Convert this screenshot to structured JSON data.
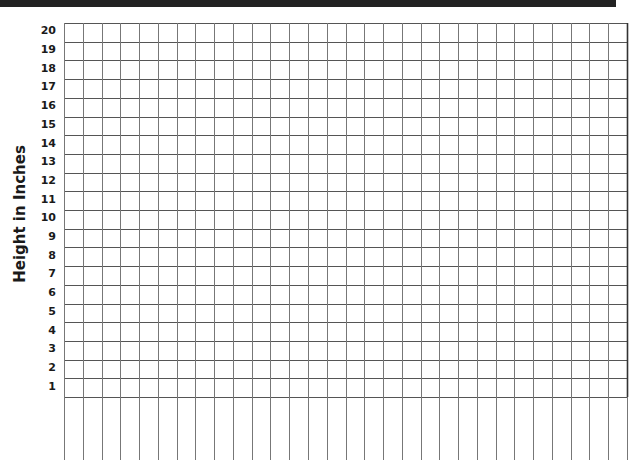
{
  "chart_data": {
    "type": "bar",
    "title": "",
    "xlabel": "",
    "ylabel": "Height in Inches",
    "ylim": [
      0,
      20
    ],
    "y_ticks": [
      "1",
      "2",
      "3",
      "4",
      "5",
      "6",
      "7",
      "8",
      "9",
      "10",
      "11",
      "12",
      "13",
      "14",
      "15",
      "16",
      "17",
      "18",
      "19",
      "20"
    ],
    "categories": [],
    "values": [],
    "grid": true,
    "grid_columns": 30,
    "grid_rows": 20,
    "legend": null,
    "note": "Blank grid worksheet; no data plotted"
  },
  "colors": {
    "grid_line": "#555555",
    "frame": "#222222",
    "text": "#1a1a1a"
  }
}
